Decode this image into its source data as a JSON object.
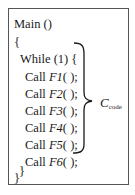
{
  "code": {
    "lines": [
      {
        "indent": 0,
        "text": "Main ()"
      },
      {
        "indent": 0,
        "text": "{"
      },
      {
        "indent": 1,
        "text": "While (1) {"
      },
      {
        "indent": 2,
        "prefix": "Call ",
        "func": "F1",
        "suffix": "( );"
      },
      {
        "indent": 2,
        "prefix": "Call ",
        "func": "F2",
        "suffix": "( );"
      },
      {
        "indent": 2,
        "prefix": "Call ",
        "func": "F3",
        "suffix": "( );"
      },
      {
        "indent": 2,
        "prefix": "Call ",
        "func": "F4",
        "suffix": "( );"
      },
      {
        "indent": 2,
        "prefix": "Call ",
        "func": "F5",
        "suffix": "( );"
      },
      {
        "indent": 2,
        "prefix": "Call ",
        "func": "F6",
        "suffix": "( );"
      },
      {
        "indent": 1,
        "text": "}"
      },
      {
        "indent": 0,
        "text": "}"
      }
    ]
  },
  "annotation": {
    "symbol": "C",
    "subscript": "code"
  },
  "colors": {
    "border": "#555555",
    "text": "#1a1a1a"
  }
}
